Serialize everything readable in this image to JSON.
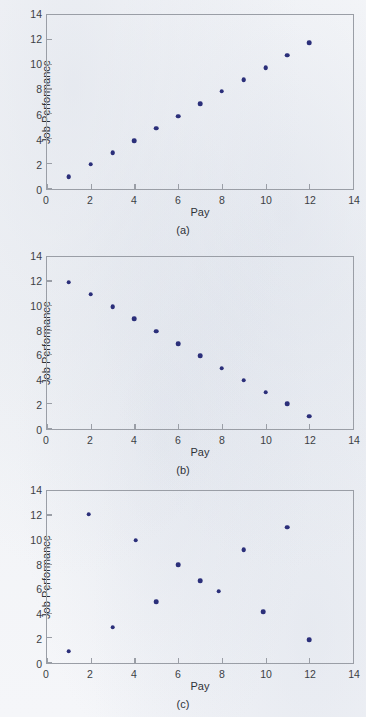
{
  "figure": {
    "background_color": "#f3f4f7",
    "marker_color": "#2b2f7a",
    "axis_color": "#9a9ea6"
  },
  "chart_data": [
    {
      "type": "scatter",
      "panel": "a",
      "caption": "(a)",
      "title": "",
      "xlabel": "Pay",
      "ylabel": "Job Performance",
      "xlim": [
        0,
        14
      ],
      "ylim": [
        0,
        14
      ],
      "xticks": [
        0,
        2,
        4,
        6,
        8,
        10,
        12,
        14
      ],
      "yticks": [
        0,
        2,
        4,
        6,
        8,
        10,
        12,
        14
      ],
      "xtick_labels": [
        "0",
        "2",
        "4",
        "6",
        "8",
        "10",
        "12",
        "14"
      ],
      "ytick_labels": [
        "0",
        "2",
        "4",
        "6",
        "8",
        "10",
        "12",
        "14"
      ],
      "grid": false,
      "legend": "none",
      "relationship": "positive correlation",
      "x": [
        1,
        2,
        3,
        4,
        5,
        6,
        7,
        8,
        9,
        10,
        11,
        12
      ],
      "y": [
        1.0,
        2.0,
        2.9,
        3.9,
        4.9,
        5.85,
        6.85,
        7.85,
        8.8,
        9.75,
        10.75,
        11.75
      ]
    },
    {
      "type": "scatter",
      "panel": "b",
      "caption": "(b)",
      "title": "",
      "xlabel": "Pay",
      "ylabel": "Job Performance",
      "xlim": [
        0,
        14
      ],
      "ylim": [
        0,
        14
      ],
      "xticks": [
        0,
        2,
        4,
        6,
        8,
        10,
        12,
        14
      ],
      "yticks": [
        0,
        2,
        4,
        6,
        8,
        10,
        12,
        14
      ],
      "xtick_labels": [
        "0",
        "2",
        "4",
        "6",
        "8",
        "10",
        "12",
        "14"
      ],
      "ytick_labels": [
        "0",
        "2",
        "4",
        "6",
        "8",
        "10",
        "12",
        "14"
      ],
      "grid": false,
      "legend": "none",
      "relationship": "negative correlation",
      "x": [
        1,
        2,
        3,
        4,
        5,
        6,
        7,
        8,
        9,
        10,
        11,
        12
      ],
      "y": [
        11.95,
        10.95,
        9.95,
        8.95,
        7.95,
        6.95,
        5.95,
        4.95,
        3.95,
        3.0,
        2.05,
        1.05
      ]
    },
    {
      "type": "scatter",
      "panel": "c",
      "caption": "(c)",
      "title": "",
      "xlabel": "Pay",
      "ylabel": "Job Performance",
      "xlim": [
        0,
        14
      ],
      "ylim": [
        0,
        14
      ],
      "xticks": [
        0,
        2,
        4,
        6,
        8,
        10,
        12,
        14
      ],
      "yticks": [
        0,
        2,
        4,
        6,
        8,
        10,
        12,
        14
      ],
      "xtick_labels": [
        "0",
        "2",
        "4",
        "6",
        "8",
        "10",
        "12",
        "14"
      ],
      "ytick_labels": [
        "0",
        "2",
        "4",
        "6",
        "8",
        "10",
        "12",
        "14"
      ],
      "grid": false,
      "legend": "none",
      "relationship": "no correlation",
      "x": [
        1,
        1.9,
        3,
        4.05,
        5,
        6,
        7,
        7.85,
        9,
        9.9,
        11,
        12
      ],
      "y": [
        0.95,
        12.1,
        2.9,
        10.0,
        5.0,
        8.0,
        6.7,
        5.85,
        9.2,
        4.15,
        11.05,
        1.9
      ]
    }
  ]
}
